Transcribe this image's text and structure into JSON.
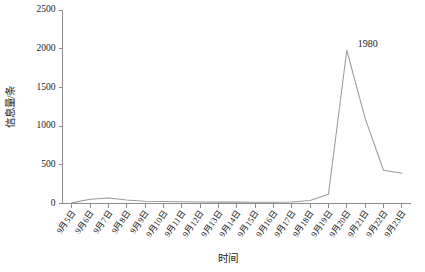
{
  "chart_data": {
    "type": "line",
    "title": "",
    "xlabel": "时间",
    "ylabel": "信息量/条",
    "categories": [
      "9月5日",
      "9月6日",
      "9月7日",
      "9月8日",
      "9月9日",
      "9月10日",
      "9月11日",
      "9月12日",
      "9月13日",
      "9月14日",
      "9月15日",
      "9月16日",
      "9月17日",
      "9月18日",
      "9月19日",
      "9月20日",
      "9月21日",
      "9月22日",
      "9月23日"
    ],
    "values": [
      8,
      55,
      70,
      45,
      30,
      25,
      22,
      20,
      18,
      18,
      16,
      15,
      20,
      40,
      120,
      1980,
      1100,
      430,
      390
    ],
    "ylim": [
      0,
      2500
    ],
    "yticks": [
      0,
      500,
      1000,
      1500,
      2000,
      2500
    ],
    "ytick_labels": [
      "0",
      "500",
      "1000",
      "1500",
      "2000",
      "2500"
    ],
    "grid": false,
    "legend": null,
    "annotations": [
      {
        "label": "1980",
        "category": "9月20日",
        "value": 1980
      }
    ],
    "series_color": "#9a9a9a",
    "axis_color": "#8c8c8c"
  }
}
